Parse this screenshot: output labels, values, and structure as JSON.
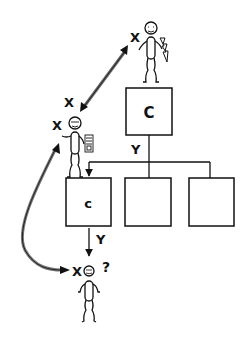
{
  "diagram": {
    "type": "org-structure-communication",
    "colors": {
      "stroke": "#111111",
      "arrow_fill": "#222222",
      "curve_fill": "#777777",
      "background": "#ffffff"
    },
    "people": [
      {
        "id": "top-person",
        "label": "X",
        "prop": "lightning-bolt"
      },
      {
        "id": "middle-person",
        "label": "X",
        "prop": "document"
      },
      {
        "id": "bottom-person",
        "label": "X",
        "annotation": "?"
      }
    ],
    "boxes": [
      {
        "id": "big-box",
        "label": "C"
      },
      {
        "id": "child-box-1",
        "label": "c"
      },
      {
        "id": "child-box-2",
        "label": ""
      },
      {
        "id": "child-box-3",
        "label": ""
      }
    ],
    "edge_labels": {
      "top_to_children": "Y",
      "child_to_bottom": "Y",
      "arrow_top_label": "X"
    },
    "question_mark": "?"
  }
}
